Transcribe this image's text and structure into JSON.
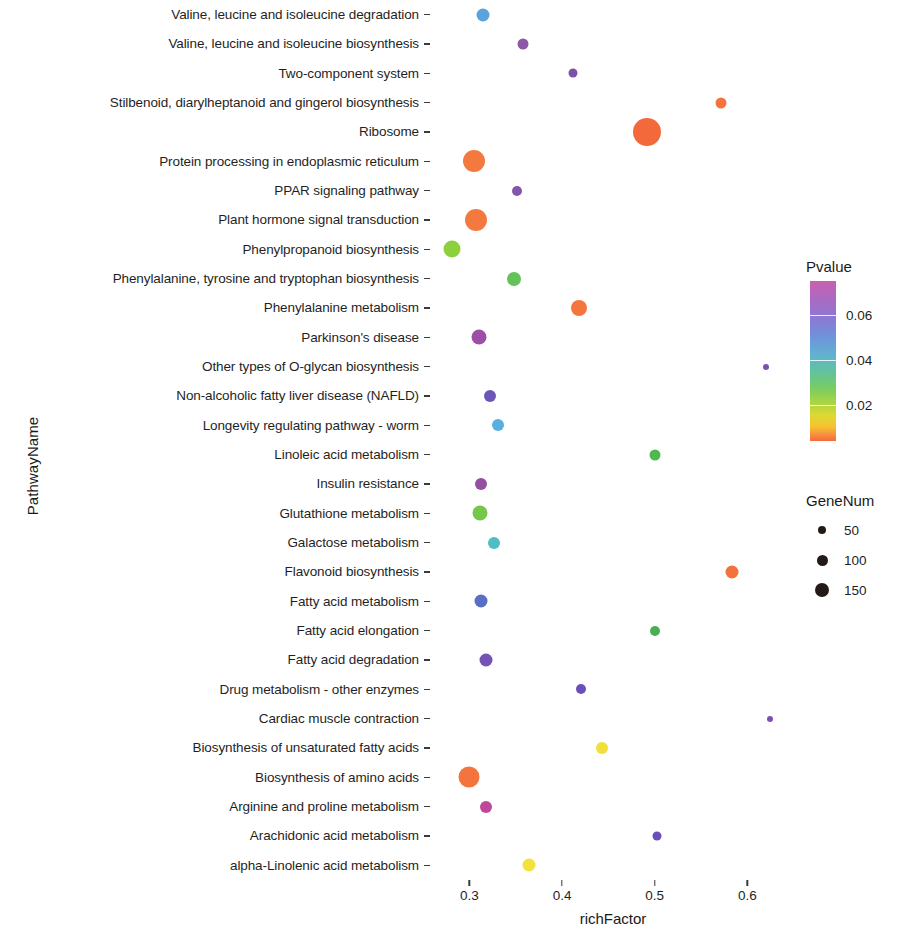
{
  "chart_data": {
    "type": "scatter",
    "title": "",
    "xlabel": "richFactor",
    "ylabel": "PathwayName",
    "xlim": [
      0.265,
      0.645
    ],
    "xticks": [
      0.3,
      0.4,
      0.5,
      0.6
    ],
    "xtick_labels": [
      "0.3",
      "0.4",
      "0.5",
      "0.6"
    ],
    "grid": false,
    "legend_position": "right",
    "color_legend": {
      "title": "Pvalue",
      "ticks": [
        0.02,
        0.04,
        0.06
      ],
      "tick_labels": [
        "0.02",
        "0.04",
        "0.06"
      ],
      "range": [
        0.004,
        0.075
      ],
      "low_color": "#f4693c",
      "mid_color": "#79cc62",
      "high_color": "#c861b0"
    },
    "size_legend": {
      "title": "GeneNum",
      "breaks": [
        50,
        100,
        150
      ],
      "break_labels": [
        "50",
        "100",
        "150"
      ],
      "dot_px": [
        8,
        11,
        14
      ]
    },
    "categories": [
      "Valine, leucine and isoleucine degradation",
      "Valine, leucine and isoleucine biosynthesis",
      "Two-component system",
      "Stilbenoid, diarylheptanoid and gingerol biosynthesis",
      "Ribosome",
      "Protein processing in endoplasmic reticulum",
      "PPAR signaling pathway",
      "Plant hormone signal transduction",
      "Phenylpropanoid biosynthesis",
      "Phenylalanine, tyrosine and tryptophan biosynthesis",
      "Phenylalanine metabolism",
      "Parkinson's disease",
      "Other types of O-glycan biosynthesis",
      "Non-alcoholic fatty liver disease (NAFLD)",
      "Longevity regulating pathway - worm",
      "Linoleic acid metabolism",
      "Insulin resistance",
      "Glutathione metabolism",
      "Galactose metabolism",
      "Flavonoid biosynthesis",
      "Fatty acid metabolism",
      "Fatty acid elongation",
      "Fatty acid degradation",
      "Drug metabolism - other enzymes",
      "Cardiac muscle contraction",
      "Biosynthesis of unsaturated fatty acids",
      "Biosynthesis of amino acids",
      "Arginine and proline metabolism",
      "Arachidonic acid metabolism",
      "alpha-Linolenic acid metabolism"
    ],
    "points": [
      {
        "pathway": "Valine, leucine and isoleucine degradation",
        "richFactor": 0.315,
        "pvalue": 0.05,
        "geneNum": 38,
        "color": "#5ba3dd",
        "size_px": 13
      },
      {
        "pathway": "Valine, leucine and isoleucine biosynthesis",
        "richFactor": 0.358,
        "pvalue": 0.066,
        "geneNum": 26,
        "color": "#8f57a8",
        "size_px": 11
      },
      {
        "pathway": "Two-component system",
        "richFactor": 0.412,
        "pvalue": 0.068,
        "geneNum": 16,
        "color": "#7b52a8",
        "size_px": 9
      },
      {
        "pathway": "Stilbenoid, diarylheptanoid and gingerol biosynthesis",
        "richFactor": 0.572,
        "pvalue": 0.01,
        "geneNum": 22,
        "color": "#f4743e",
        "size_px": 11
      },
      {
        "pathway": "Ribosome",
        "richFactor": 0.492,
        "pvalue": 0.008,
        "geneNum": 155,
        "color": "#f4693c",
        "size_px": 28
      },
      {
        "pathway": "Protein processing in endoplasmic reticulum",
        "richFactor": 0.305,
        "pvalue": 0.009,
        "geneNum": 120,
        "color": "#f4793e",
        "size_px": 22
      },
      {
        "pathway": "PPAR signaling pathway",
        "richFactor": 0.351,
        "pvalue": 0.067,
        "geneNum": 18,
        "color": "#8257ab",
        "size_px": 10
      },
      {
        "pathway": "Plant hormone signal transduction",
        "richFactor": 0.307,
        "pvalue": 0.009,
        "geneNum": 118,
        "color": "#f4793e",
        "size_px": 22
      },
      {
        "pathway": "Phenylpropanoid biosynthesis",
        "richFactor": 0.281,
        "pvalue": 0.026,
        "geneNum": 60,
        "color": "#8cd13d",
        "size_px": 17
      },
      {
        "pathway": "Phenylalanine, tyrosine and tryptophan biosynthesis",
        "richFactor": 0.348,
        "pvalue": 0.032,
        "geneNum": 40,
        "color": "#63c258",
        "size_px": 14
      },
      {
        "pathway": "Phenylalanine metabolism",
        "richFactor": 0.418,
        "pvalue": 0.011,
        "geneNum": 52,
        "color": "#f4753d",
        "size_px": 16
      },
      {
        "pathway": "Parkinson's disease",
        "richFactor": 0.31,
        "pvalue": 0.072,
        "geneNum": 46,
        "color": "#9c4fa4",
        "size_px": 15
      },
      {
        "pathway": "Other types of O-glycan biosynthesis",
        "richFactor": 0.62,
        "pvalue": 0.07,
        "geneNum": 6,
        "color": "#7b52b0",
        "size_px": 6
      },
      {
        "pathway": "Non-alcoholic fatty liver disease (NAFLD)",
        "richFactor": 0.322,
        "pvalue": 0.069,
        "geneNum": 32,
        "color": "#6e56b8",
        "size_px": 12
      },
      {
        "pathway": "Longevity regulating pathway - worm",
        "richFactor": 0.331,
        "pvalue": 0.048,
        "geneNum": 30,
        "color": "#58b0e0",
        "size_px": 12
      },
      {
        "pathway": "Linoleic acid metabolism",
        "richFactor": 0.5,
        "pvalue": 0.033,
        "geneNum": 22,
        "color": "#4fb84f",
        "size_px": 11
      },
      {
        "pathway": "Insulin resistance",
        "richFactor": 0.313,
        "pvalue": 0.071,
        "geneNum": 30,
        "color": "#94509f",
        "size_px": 12
      },
      {
        "pathway": "Glutathione metabolism",
        "richFactor": 0.311,
        "pvalue": 0.029,
        "geneNum": 44,
        "color": "#77c64c",
        "size_px": 15
      },
      {
        "pathway": "Galactose metabolism",
        "richFactor": 0.326,
        "pvalue": 0.043,
        "geneNum": 32,
        "color": "#4fbdc4",
        "size_px": 12
      },
      {
        "pathway": "Flavonoid biosynthesis",
        "richFactor": 0.583,
        "pvalue": 0.01,
        "geneNum": 30,
        "color": "#f4703d",
        "size_px": 13
      },
      {
        "pathway": "Fatty acid metabolism",
        "richFactor": 0.312,
        "pvalue": 0.059,
        "geneNum": 38,
        "color": "#5a6fc4",
        "size_px": 13
      },
      {
        "pathway": "Fatty acid elongation",
        "richFactor": 0.5,
        "pvalue": 0.034,
        "geneNum": 18,
        "color": "#4aae56",
        "size_px": 10
      },
      {
        "pathway": "Fatty acid degradation",
        "richFactor": 0.318,
        "pvalue": 0.068,
        "geneNum": 34,
        "color": "#7553b4",
        "size_px": 13
      },
      {
        "pathway": "Drug metabolism - other enzymes",
        "richFactor": 0.42,
        "pvalue": 0.069,
        "geneNum": 20,
        "color": "#6b4fb8",
        "size_px": 10
      },
      {
        "pathway": "Cardiac muscle contraction",
        "richFactor": 0.624,
        "pvalue": 0.07,
        "geneNum": 6,
        "color": "#7b52b0",
        "size_px": 6
      },
      {
        "pathway": "Biosynthesis of unsaturated fatty acids",
        "richFactor": 0.443,
        "pvalue": 0.02,
        "geneNum": 24,
        "color": "#f2e03a",
        "size_px": 12
      },
      {
        "pathway": "Biosynthesis of amino acids",
        "richFactor": 0.3,
        "pvalue": 0.01,
        "geneNum": 110,
        "color": "#f4743e",
        "size_px": 21
      },
      {
        "pathway": "Arginine and proline metabolism",
        "richFactor": 0.318,
        "pvalue": 0.074,
        "geneNum": 32,
        "color": "#c0479a",
        "size_px": 12
      },
      {
        "pathway": "Arachidonic acid metabolism",
        "richFactor": 0.503,
        "pvalue": 0.069,
        "geneNum": 14,
        "color": "#6b4fb8",
        "size_px": 9
      },
      {
        "pathway": "alpha-Linolenic acid metabolism",
        "richFactor": 0.364,
        "pvalue": 0.019,
        "geneNum": 24,
        "color": "#f4e23c",
        "size_px": 13
      }
    ]
  }
}
